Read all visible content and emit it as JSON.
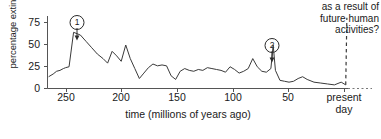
{
  "chart_data": {
    "type": "line",
    "title": "",
    "xlabel": "time (millions of years ago)",
    "ylabel": "percentage extinctions",
    "xlim": [
      265,
      0
    ],
    "ylim": [
      0,
      80
    ],
    "x_ticks": [
      250,
      200,
      150,
      100,
      50
    ],
    "x_tick_labels": [
      "250",
      "200",
      "150",
      "100",
      "50"
    ],
    "x_end_label_line1": "present",
    "x_end_label_line2": "day",
    "y_ticks": [
      0,
      25,
      50,
      75
    ],
    "y_tick_labels": [
      "0",
      "25",
      "50",
      "75"
    ],
    "grid": false,
    "legend": "none",
    "line_color": "#3a3a3a",
    "axis_color": "#555555",
    "series": [
      {
        "name": "percentage extinctions",
        "x": [
          264,
          260,
          257,
          254,
          251,
          249,
          246,
          242,
          236,
          231,
          226,
          221,
          216,
          212,
          208,
          204,
          200,
          196,
          192,
          188,
          184,
          180,
          176,
          172,
          168,
          164,
          160,
          156,
          152,
          148,
          144,
          140,
          136,
          132,
          128,
          124,
          120,
          116,
          112,
          108,
          104,
          100,
          96,
          92,
          88,
          84,
          80,
          76,
          72,
          68,
          66,
          64,
          60,
          56,
          52,
          48,
          44,
          40,
          36,
          30,
          24,
          18,
          12,
          6,
          2
        ],
        "values": [
          13,
          16,
          19,
          20,
          22,
          23,
          24,
          62,
          59,
          52,
          45,
          38,
          33,
          28,
          41,
          36,
          30,
          48,
          33,
          22,
          11,
          17,
          23,
          27,
          25,
          26,
          25,
          14,
          10,
          19,
          22,
          20,
          19,
          21,
          20,
          23,
          22,
          21,
          20,
          18,
          24,
          21,
          17,
          19,
          22,
          33,
          24,
          19,
          18,
          22,
          48,
          20,
          9,
          8,
          7,
          8,
          11,
          13,
          10,
          7,
          6,
          5,
          4,
          7,
          4
        ]
      }
    ],
    "projection": {
      "name": "future projection",
      "style": "dashed",
      "x": [
        2,
        1
      ],
      "values": [
        4,
        78
      ]
    },
    "annotations": [
      {
        "id": "1",
        "label": "1",
        "x": 242,
        "value": 62,
        "style": "circled-number-with-arrow"
      },
      {
        "id": "2",
        "label": "2",
        "x": 66,
        "value": 48,
        "style": "circled-number-with-arrow"
      }
    ],
    "text_annotation": {
      "line1": "as a result of",
      "line2": "future human",
      "line3": "activities?"
    }
  }
}
